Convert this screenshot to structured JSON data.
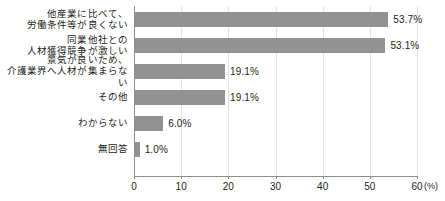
{
  "chart_data": {
    "type": "bar",
    "orientation": "horizontal",
    "title": "",
    "xlabel": "(%)",
    "ylabel": "",
    "xlim": [
      0,
      60
    ],
    "xticks": [
      0,
      10,
      20,
      30,
      40,
      50,
      60
    ],
    "xtick_labels": [
      "0",
      "10",
      "20",
      "30",
      "40",
      "50",
      "60"
    ],
    "unit_label": "(%)",
    "grid": true,
    "grid_axis": "x",
    "legend": false,
    "bar_color": "#929292",
    "axis_color": "#8d8d8d",
    "grid_color": "#e3e3e3",
    "text_color": "#231f20",
    "categories": [
      "他産業に比べて、\n労働条件等が良くない",
      "同業他社との\n人材獲得競争が激しい",
      "景気が良いため、\n介護業界へ人材が集まらない",
      "その他",
      "わからない",
      "無回答"
    ],
    "values": [
      53.7,
      53.1,
      19.1,
      19.1,
      6.0,
      1.0
    ],
    "value_labels": [
      "53.7%",
      "53.1%",
      "19.1%",
      "19.1%",
      "6.0%",
      "1.0%"
    ]
  }
}
